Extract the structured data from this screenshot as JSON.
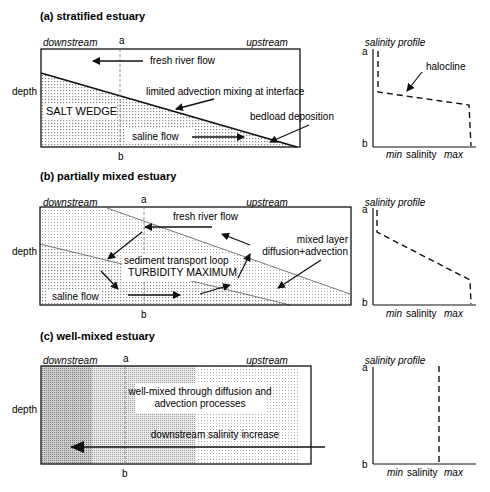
{
  "panels": [
    {
      "title": "(a) stratified estuary",
      "downstream": "downstream",
      "upstream": "upstream",
      "depth": "depth",
      "a": "a",
      "b": "b",
      "labels": {
        "fresh": "fresh river flow",
        "interface": "limited advection mixing at interface",
        "wedge": "SALT WEDGE",
        "bedload": "bedload deposition",
        "saline": "saline flow"
      },
      "profile": {
        "title": "salinity profile",
        "annotation": "halocline",
        "xmin": "min",
        "xlabel": "salinity",
        "xmax": "max",
        "a": "a",
        "b": "b"
      }
    },
    {
      "title": "(b) partially mixed estuary",
      "downstream": "downstream",
      "upstream": "upstream",
      "depth": "depth",
      "a": "a",
      "b": "b",
      "labels": {
        "fresh": "fresh river flow",
        "loop": "sediment transport loop",
        "turbidity": "TURBIDITY MAXIMUM",
        "mixed1": "mixed layer",
        "mixed2": "diffusion+advection",
        "saline": "saline flow"
      },
      "profile": {
        "title": "salinity profile",
        "xmin": "min",
        "xlabel": "salinity",
        "xmax": "max",
        "a": "a",
        "b": "b"
      }
    },
    {
      "title": "(c) well-mixed estuary",
      "downstream": "downstream",
      "upstream": "upstream",
      "depth": "depth",
      "a": "a",
      "b": "b",
      "labels": {
        "wellmixed1": "well-mixed through diffusion and",
        "wellmixed2": "advection processes",
        "increase": "downstream salinity increase"
      },
      "profile": {
        "title": "salinity profile",
        "xmin": "min",
        "xlabel": "salinity",
        "xmax": "max",
        "a": "a",
        "b": "b"
      }
    }
  ]
}
